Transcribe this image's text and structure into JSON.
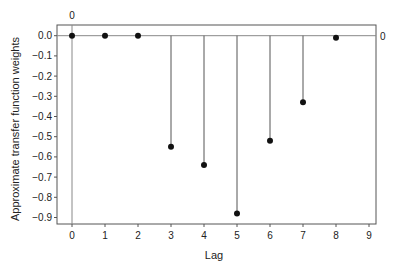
{
  "chart_data": {
    "type": "stem",
    "title": "",
    "xlabel": "Lag",
    "ylabel": "Approximate transfer function weights",
    "x": [
      0,
      1,
      2,
      3,
      4,
      5,
      6,
      7,
      8
    ],
    "values": [
      0.0,
      0.0,
      0.0,
      -0.55,
      -0.64,
      -0.88,
      -0.52,
      -0.33,
      -0.01
    ],
    "xlim": [
      -0.45,
      9.2
    ],
    "ylim": [
      -0.93,
      0.05
    ],
    "xticks": [
      "0",
      "1",
      "2",
      "3",
      "4",
      "5",
      "6",
      "7",
      "8",
      "9"
    ],
    "yticks": [
      "0.0",
      "-0.1",
      "-0.2",
      "-0.3",
      "-0.4",
      "-0.5",
      "-0.6",
      "-0.7",
      "-0.8",
      "-0.9"
    ],
    "reference_lines": {
      "vertical_at_x": 0,
      "vertical_label": "0",
      "horizontal_at_y": 0,
      "horizontal_label": "0"
    },
    "grid": false,
    "legend": null,
    "colors": {
      "stem": "#555555",
      "marker": "#111111",
      "axis": "#555555",
      "reference": "#888888"
    }
  }
}
